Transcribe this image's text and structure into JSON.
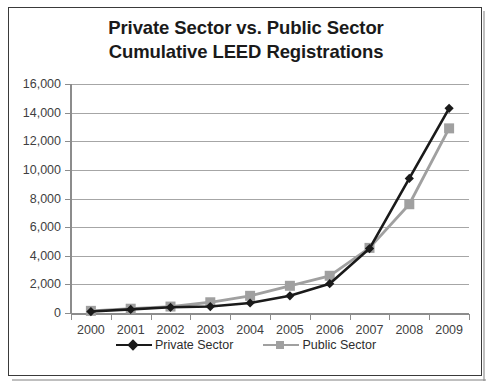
{
  "chart_data": {
    "type": "line",
    "title": "Private Sector vs. Public Sector Cumulative LEED Registrations",
    "title_lines": [
      "Private Sector vs. Public Sector",
      "Cumulative LEED Registrations"
    ],
    "xlabel": "",
    "ylabel": "",
    "categories": [
      "2000",
      "2001",
      "2002",
      "2003",
      "2004",
      "2005",
      "2006",
      "2007",
      "2008",
      "2009"
    ],
    "ylim": [
      0,
      16000
    ],
    "ytick_values": [
      0,
      2000,
      4000,
      6000,
      8000,
      10000,
      12000,
      14000,
      16000
    ],
    "ytick_labels": [
      "0",
      "2,000",
      "4,000",
      "6,000",
      "8,000",
      "10,000",
      "12,000",
      "14,000",
      "16,000"
    ],
    "grid": true,
    "legend_position": "bottom",
    "series": [
      {
        "name": "Private Sector",
        "color": "#1a1a1a",
        "marker": "diamond",
        "values": [
          100,
          250,
          400,
          450,
          700,
          1200,
          2050,
          4500,
          9400,
          14300
        ]
      },
      {
        "name": "Public Sector",
        "color": "#a0a0a0",
        "marker": "square",
        "values": [
          150,
          300,
          450,
          750,
          1200,
          1900,
          2600,
          4550,
          7600,
          12900
        ]
      }
    ]
  },
  "colors": {
    "private_sector": "#1a1a1a",
    "public_sector": "#a0a0a0",
    "gridline": "#a6a6a6",
    "axis": "#8c8c8c",
    "border": "#3a3a3a",
    "text": "#3f3f3f",
    "background": "#ffffff"
  }
}
